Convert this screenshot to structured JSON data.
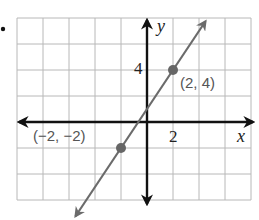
{
  "chart_data": {
    "type": "line",
    "title": "",
    "xlabel": "x",
    "ylabel": "y",
    "xlim": [
      -10,
      8
    ],
    "ylim": [
      -6,
      8
    ],
    "grid": true,
    "grid_step": 2,
    "x_tick_labels": [
      {
        "value": 2,
        "label": "2"
      }
    ],
    "y_tick_labels": [
      {
        "value": 4,
        "label": "4"
      }
    ],
    "series": [
      {
        "name": "line",
        "slope": 1.5,
        "intercept": 1,
        "x_range": [
          -5.5,
          4.5
        ],
        "color": "#6b6b6b",
        "arrows": "both"
      }
    ],
    "points": [
      {
        "x": 2,
        "y": 4,
        "label": "(2, 4)",
        "label_pos": "right-below"
      },
      {
        "x": -2,
        "y": -2,
        "label": "(−2, −2)",
        "label_pos": "left-above"
      }
    ],
    "colors": {
      "grid": "#b8b8b8",
      "axis": "#111111",
      "line": "#6b6b6b",
      "point": "#666666"
    }
  },
  "bullet_icon": "bullet-icon"
}
